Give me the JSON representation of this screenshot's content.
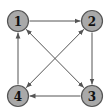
{
  "diagram": {
    "type": "directed-graph",
    "colors": {
      "node_fill": "#a9a9a9",
      "node_stroke": "#555555",
      "edge": "#555555",
      "label": "#111111",
      "background": "#ffffff"
    },
    "nodes": [
      {
        "id": "1",
        "label": "1",
        "x": 18,
        "y": 21
      },
      {
        "id": "2",
        "label": "2",
        "x": 92,
        "y": 21
      },
      {
        "id": "3",
        "label": "3",
        "x": 92,
        "y": 96
      },
      {
        "id": "4",
        "label": "4",
        "x": 18,
        "y": 96
      }
    ],
    "edges": [
      {
        "from": "1",
        "to": "2",
        "bidirectional": false
      },
      {
        "from": "2",
        "to": "3",
        "bidirectional": false
      },
      {
        "from": "3",
        "to": "4",
        "bidirectional": false
      },
      {
        "from": "4",
        "to": "1",
        "bidirectional": false
      },
      {
        "from": "1",
        "to": "3",
        "bidirectional": true
      },
      {
        "from": "2",
        "to": "4",
        "bidirectional": true
      }
    ]
  }
}
